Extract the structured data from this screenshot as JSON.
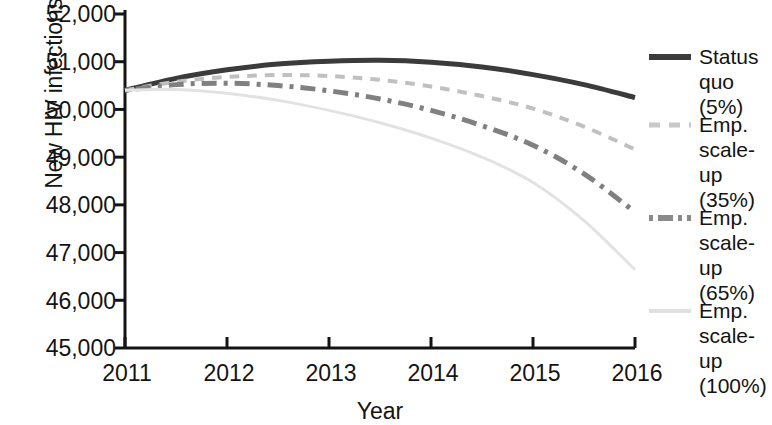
{
  "chart_data": {
    "type": "line",
    "title": "",
    "xlabel": "Year",
    "ylabel": "New HIV infections",
    "xlim": [
      2011,
      2016
    ],
    "ylim": [
      45000,
      52000
    ],
    "ytick_labels": [
      "52,000",
      "51,000",
      "50,000",
      "49,000",
      "48,000",
      "47,000",
      "46,000",
      "45,000"
    ],
    "ytick_values": [
      52000,
      51000,
      50000,
      49000,
      48000,
      47000,
      46000,
      45000
    ],
    "xtick_labels": [
      "2011",
      "2012",
      "2013",
      "2014",
      "2015",
      "2016"
    ],
    "xtick_values": [
      2011,
      2012,
      2013,
      2014,
      2015,
      2016
    ],
    "grid": false,
    "legend_position": "right",
    "x": [
      2011,
      2011.5,
      2012,
      2012.5,
      2013,
      2013.5,
      2014,
      2014.5,
      2015,
      2015.5,
      2016
    ],
    "series": [
      {
        "name": "Status quo (5%)",
        "color": "#3b3b3b",
        "style": "solid",
        "width": 5,
        "values": [
          50400,
          50650,
          50830,
          50950,
          51010,
          51030,
          50990,
          50890,
          50730,
          50520,
          50250
        ]
      },
      {
        "name": "Emp. scale-up (35%)",
        "color": "#c0c0c0",
        "style": "dashed",
        "width": 4,
        "values": [
          50400,
          50580,
          50680,
          50720,
          50700,
          50620,
          50480,
          50280,
          50020,
          49640,
          49160
        ]
      },
      {
        "name": "Emp. scale-up (65%)",
        "color": "#808080",
        "style": "dashdot",
        "width": 5,
        "values": [
          50400,
          50520,
          50550,
          50500,
          50390,
          50220,
          49980,
          49660,
          49250,
          48650,
          47850
        ]
      },
      {
        "name": "Emp. scale-up (100%)",
        "color": "#e2e2e2",
        "style": "solid",
        "width": 3,
        "values": [
          50400,
          50420,
          50340,
          50190,
          49980,
          49720,
          49400,
          49000,
          48470,
          47670,
          46640
        ]
      }
    ]
  },
  "legend": {
    "items": [
      {
        "label": "Status\nquo (5%)",
        "swatch": "solid-dark-line-icon"
      },
      {
        "label": "Emp.\nscale-up\n(35%)",
        "swatch": "dashed-light-line-icon"
      },
      {
        "label": "Emp.\nscale-up\n(65%)",
        "swatch": "dash-dot-gray-line-icon"
      },
      {
        "label": "Emp.\nscale-up\n(100%)",
        "swatch": "solid-verylight-line-icon"
      }
    ]
  },
  "axes": {
    "y_axis_title": "New HIV infections",
    "x_axis_title": "Year"
  }
}
